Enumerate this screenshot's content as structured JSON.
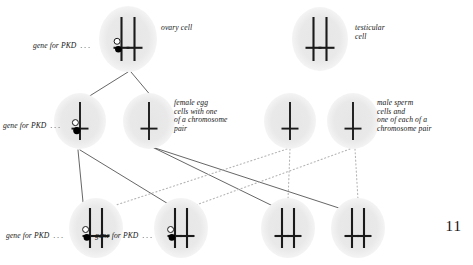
{
  "figure": {
    "page_number": "11",
    "colors": {
      "cell_fill": "#e8e8e8",
      "chromosome": "#1a1a1a",
      "gene_dot_filled": "#000000",
      "gene_dot_open": "#ffffff",
      "solid_line": "#4a4a4a",
      "dotted_line": "#b5b5b5",
      "text": "#161616",
      "background": "#ffffff"
    },
    "labels": {
      "ovary_cell": "ovary cell",
      "testicular_cell": "testicular\ncell",
      "female_egg": "female egg\ncells with one\nof a chromosome\npair",
      "male_sperm": "male sperm\ncells and\none of each of a\nchromosome pair",
      "gene_for_pkd": "gene for PKD  . . ."
    },
    "cells": [
      {
        "id": "ovary-cell",
        "name": "ovary-cell",
        "cx": 128,
        "cy": 39,
        "rx": 29,
        "ry": 33,
        "chromosomes": 2,
        "pkd_gene": true,
        "row": 1
      },
      {
        "id": "testicular-cell",
        "name": "testicular-cell",
        "cx": 320,
        "cy": 39,
        "rx": 28,
        "ry": 32,
        "chromosomes": 2,
        "pkd_gene": false,
        "row": 1
      },
      {
        "id": "egg-cell-1",
        "name": "female-egg-cell-pkd",
        "cx": 80,
        "cy": 121,
        "rx": 26,
        "ry": 28,
        "chromosomes": 1,
        "pkd_gene": true,
        "row": 2
      },
      {
        "id": "egg-cell-2",
        "name": "female-egg-cell-normal",
        "cx": 149,
        "cy": 121,
        "rx": 26,
        "ry": 28,
        "chromosomes": 1,
        "pkd_gene": false,
        "row": 2
      },
      {
        "id": "sperm-cell-1",
        "name": "male-sperm-cell-1",
        "cx": 290,
        "cy": 121,
        "rx": 26,
        "ry": 28,
        "chromosomes": 1,
        "pkd_gene": false,
        "row": 2
      },
      {
        "id": "sperm-cell-2",
        "name": "male-sperm-cell-2",
        "cx": 353,
        "cy": 121,
        "rx": 26,
        "ry": 28,
        "chromosomes": 1,
        "pkd_gene": false,
        "row": 2
      },
      {
        "id": "zygote-1",
        "name": "offspring-cell-pkd-1",
        "cx": 96,
        "cy": 228,
        "rx": 27,
        "ry": 30,
        "chromosomes": 2,
        "pkd_gene": true,
        "row": 3
      },
      {
        "id": "zygote-2",
        "name": "offspring-cell-pkd-2",
        "cx": 181,
        "cy": 228,
        "rx": 27,
        "ry": 30,
        "chromosomes": 2,
        "pkd_gene": true,
        "row": 3
      },
      {
        "id": "zygote-3",
        "name": "offspring-cell-normal-1",
        "cx": 288,
        "cy": 228,
        "rx": 27,
        "ry": 30,
        "chromosomes": 2,
        "pkd_gene": false,
        "row": 3
      },
      {
        "id": "zygote-4",
        "name": "offspring-cell-normal-2",
        "cx": 358,
        "cy": 228,
        "rx": 27,
        "ry": 30,
        "chromosomes": 2,
        "pkd_gene": false,
        "row": 3
      }
    ],
    "connections": [
      {
        "from": "ovary-cell",
        "to": "egg-cell-1",
        "style": "solid",
        "x1": 128,
        "y1": 72,
        "x2": 88,
        "y2": 97
      },
      {
        "from": "ovary-cell",
        "to": "egg-cell-2",
        "style": "solid",
        "x1": 131,
        "y1": 72,
        "x2": 152,
        "y2": 97
      },
      {
        "from": "egg-cell-1",
        "to": "zygote-1",
        "style": "solid",
        "x1": 78,
        "y1": 150,
        "x2": 83,
        "y2": 202
      },
      {
        "from": "egg-cell-1",
        "to": "zygote-2",
        "style": "solid",
        "x1": 80,
        "y1": 150,
        "x2": 170,
        "y2": 205
      },
      {
        "from": "egg-cell-2",
        "to": "zygote-3",
        "style": "solid",
        "x1": 152,
        "y1": 147,
        "x2": 275,
        "y2": 207
      },
      {
        "from": "egg-cell-2",
        "to": "zygote-4",
        "style": "solid",
        "x1": 152,
        "y1": 147,
        "x2": 345,
        "y2": 210
      },
      {
        "from": "sperm-cell-1",
        "to": "zygote-1",
        "style": "dotted",
        "x1": 287,
        "y1": 149,
        "x2": 116,
        "y2": 205
      },
      {
        "from": "sperm-cell-1",
        "to": "zygote-3",
        "style": "dotted",
        "x1": 290,
        "y1": 149,
        "x2": 288,
        "y2": 200
      },
      {
        "from": "sperm-cell-2",
        "to": "zygote-2",
        "style": "dotted",
        "x1": 350,
        "y1": 149,
        "x2": 196,
        "y2": 205
      },
      {
        "from": "sperm-cell-2",
        "to": "zygote-4",
        "style": "dotted",
        "x1": 355,
        "y1": 149,
        "x2": 358,
        "y2": 200
      }
    ],
    "gene_annotations": [
      {
        "for": "ovary-cell",
        "x": 33,
        "y": 42,
        "align": "right"
      },
      {
        "for": "egg-cell-1",
        "x": 3,
        "y": 122,
        "align": "right"
      },
      {
        "for": "zygote-1",
        "x": 6,
        "y": 232,
        "align": "right"
      },
      {
        "for": "zygote-2",
        "x": 95,
        "y": 232,
        "align": "right"
      }
    ]
  }
}
